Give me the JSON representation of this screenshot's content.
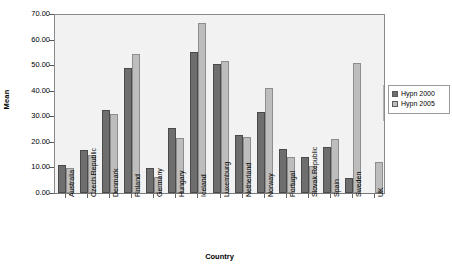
{
  "chart_data": {
    "type": "bar",
    "title": "",
    "xlabel": "Country",
    "ylabel": "Mean",
    "ylim": [
      0,
      70
    ],
    "ytick_step": 10,
    "ytick_labels": [
      "0.00",
      "10.00",
      "20.00",
      "30.00",
      "40.00",
      "50.00",
      "60.00",
      "70.00"
    ],
    "ytick_values": [
      0,
      10,
      20,
      30,
      40,
      50,
      60,
      70
    ],
    "grid": false,
    "legend_position": "right",
    "categories": [
      "Australia",
      "Czech Republic",
      "Denmark",
      "Finland",
      "Germany",
      "Hungary",
      "Iceland",
      "Luxemburg",
      "Netherland",
      "Norway",
      "Portugal",
      "Slovak Republic",
      "Spain",
      "Sweden",
      "UK"
    ],
    "series": [
      {
        "name": "Hypn 2000",
        "color": "#6e6e6e",
        "values": [
          11.0,
          17.0,
          32.5,
          48.8,
          9.8,
          25.3,
          55.2,
          50.3,
          22.5,
          31.5,
          17.2,
          14.2,
          17.8,
          5.7,
          0.0
        ]
      },
      {
        "name": "Hypn 2005",
        "color": "#bdbdbd",
        "values": [
          9.8,
          15.0,
          31.0,
          54.3,
          6.2,
          21.5,
          66.5,
          51.8,
          21.8,
          41.0,
          14.0,
          10.5,
          21.2,
          50.7,
          12.2
        ]
      }
    ]
  },
  "axes": {
    "y_title": "Mean",
    "x_title": "Country"
  },
  "legend": {
    "items": [
      {
        "label": "Hypn 2000",
        "swatch": "dark-gray-swatch"
      },
      {
        "label": "Hypn 2005",
        "swatch": "light-gray-swatch"
      }
    ]
  }
}
